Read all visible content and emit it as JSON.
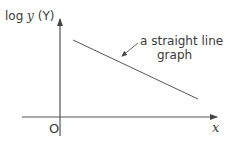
{
  "diagram": {
    "y_axis_label_prefix": "log ",
    "y_axis_label_var": "y",
    "y_axis_label_suffix": " (Y)",
    "x_axis_label": "x",
    "origin_label": "O",
    "annotation_line1": "a straight line",
    "annotation_line2": "graph",
    "colors": {
      "stroke": "#555555",
      "text": "#3a3a3a",
      "background": "#ffffff"
    }
  }
}
